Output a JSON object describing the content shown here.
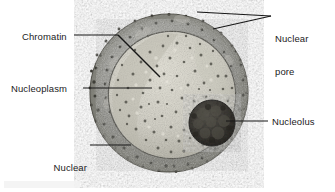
{
  "figure": {
    "type": "labeled-micrograph-illustration",
    "background_color": "#ffffff",
    "leader_line_color": "#1a1a1a",
    "text_color": "#1b1b1b"
  },
  "labels": {
    "chromatin": "Chromatin",
    "nucleoplasm": "Nucleoplasm",
    "nuclear_envelope_line1": "Nuclear",
    "nuclear_envelope_line2": "envelope",
    "nuclear_pore_line1": "Nuclear",
    "nuclear_pore_line2": "pore",
    "nucleolus": "Nucleolus"
  },
  "structures": {
    "nucleus": {
      "name": "nucleus",
      "center_x": 169,
      "center_y": 93,
      "radius": 79,
      "fill_color": "#9a9a96"
    },
    "nuclear_envelope": {
      "name": "nuclear-envelope",
      "band_color": "#8e8e8a",
      "inner_line_color": "#56564f",
      "thickness": 17
    },
    "nucleoplasm": {
      "name": "nucleoplasm",
      "center_x": 172,
      "center_y": 95,
      "radius": 63,
      "fill_color": "#d8d6cd"
    },
    "nucleolus": {
      "name": "nucleolus",
      "center_x": 212,
      "center_y": 123,
      "radius": 23,
      "fill_color": "#3e3c38"
    },
    "nuclear_pore": {
      "name": "nuclear-pore",
      "dot_color": "#3a3a34",
      "count_visible": 64
    }
  }
}
